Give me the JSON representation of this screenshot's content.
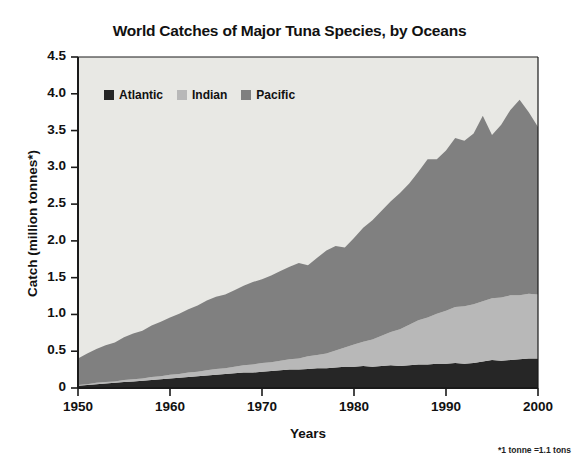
{
  "chart_data": {
    "type": "area",
    "stacked": true,
    "title": "World Catches of Major Tuna Species, by Oceans",
    "xlabel": "Years",
    "ylabel": "Catch (million tonnes*)",
    "footnote": "*1 tonne =1.1 tons",
    "xlim": [
      1950,
      2000
    ],
    "ylim": [
      0,
      4.5
    ],
    "grid": false,
    "legend_position": "top-left-inside",
    "plot_background": "#e8e8e4",
    "xticks": [
      1950,
      1960,
      1970,
      1980,
      1990,
      2000
    ],
    "xtick_labels": [
      "1950",
      "1960",
      "1970",
      "1980",
      "1990",
      "2000"
    ],
    "yticks": [
      0,
      0.5,
      1.0,
      1.5,
      2.0,
      2.5,
      3.0,
      3.5,
      4.0,
      4.5
    ],
    "ytick_labels": [
      "0",
      "0.5",
      "1.0",
      "1.5",
      "2.0",
      "2.5",
      "3.0",
      "3.5",
      "4.0",
      "4.5"
    ],
    "x": [
      1950,
      1951,
      1952,
      1953,
      1954,
      1955,
      1956,
      1957,
      1958,
      1959,
      1960,
      1961,
      1962,
      1963,
      1964,
      1965,
      1966,
      1967,
      1968,
      1969,
      1970,
      1971,
      1972,
      1973,
      1974,
      1975,
      1976,
      1977,
      1978,
      1979,
      1980,
      1981,
      1982,
      1983,
      1984,
      1985,
      1986,
      1987,
      1988,
      1989,
      1990,
      1991,
      1992,
      1993,
      1994,
      1995,
      1996,
      1997,
      1998,
      1999,
      2000
    ],
    "series": [
      {
        "name": "Atlantic",
        "color": "#262626",
        "values": [
          0.03,
          0.04,
          0.05,
          0.06,
          0.07,
          0.08,
          0.09,
          0.1,
          0.11,
          0.12,
          0.13,
          0.14,
          0.15,
          0.16,
          0.17,
          0.18,
          0.19,
          0.2,
          0.21,
          0.21,
          0.22,
          0.23,
          0.24,
          0.25,
          0.25,
          0.26,
          0.27,
          0.27,
          0.28,
          0.29,
          0.29,
          0.3,
          0.29,
          0.3,
          0.31,
          0.3,
          0.31,
          0.32,
          0.32,
          0.33,
          0.33,
          0.34,
          0.33,
          0.34,
          0.36,
          0.38,
          0.37,
          0.38,
          0.39,
          0.4,
          0.4
        ]
      },
      {
        "name": "Indian",
        "color": "#b8b8b8",
        "values": [
          0.01,
          0.01,
          0.02,
          0.02,
          0.02,
          0.03,
          0.03,
          0.03,
          0.04,
          0.04,
          0.05,
          0.05,
          0.06,
          0.06,
          0.07,
          0.08,
          0.08,
          0.09,
          0.1,
          0.11,
          0.12,
          0.12,
          0.13,
          0.14,
          0.15,
          0.17,
          0.18,
          0.2,
          0.23,
          0.26,
          0.3,
          0.33,
          0.37,
          0.41,
          0.45,
          0.5,
          0.55,
          0.6,
          0.64,
          0.68,
          0.72,
          0.76,
          0.78,
          0.8,
          0.82,
          0.84,
          0.86,
          0.88,
          0.87,
          0.88,
          0.87
        ]
      },
      {
        "name": "Pacific",
        "color": "#808080",
        "values": [
          0.36,
          0.42,
          0.46,
          0.5,
          0.53,
          0.58,
          0.62,
          0.65,
          0.7,
          0.74,
          0.78,
          0.82,
          0.86,
          0.9,
          0.95,
          0.98,
          1.0,
          1.04,
          1.08,
          1.12,
          1.14,
          1.18,
          1.22,
          1.26,
          1.3,
          1.24,
          1.32,
          1.4,
          1.42,
          1.36,
          1.45,
          1.55,
          1.62,
          1.7,
          1.78,
          1.85,
          1.92,
          2.02,
          2.15,
          2.1,
          2.18,
          2.3,
          2.25,
          2.32,
          2.52,
          2.22,
          2.35,
          2.52,
          2.66,
          2.47,
          2.28
        ]
      }
    ],
    "totals": [
      0.4,
      0.47,
      0.53,
      0.58,
      0.62,
      0.69,
      0.74,
      0.78,
      0.85,
      0.9,
      0.96,
      1.01,
      1.07,
      1.12,
      1.19,
      1.24,
      1.27,
      1.33,
      1.39,
      1.44,
      1.48,
      1.53,
      1.59,
      1.65,
      1.7,
      1.67,
      1.77,
      1.87,
      1.93,
      1.91,
      2.04,
      2.18,
      2.28,
      2.41,
      2.54,
      2.65,
      2.78,
      2.94,
      3.11,
      3.11,
      3.23,
      3.4,
      3.36,
      3.46,
      3.7,
      3.44,
      3.58,
      3.78,
      3.92,
      3.75,
      3.55
    ]
  },
  "legend": {
    "items": [
      {
        "label": "Atlantic",
        "color": "#262626"
      },
      {
        "label": "Indian",
        "color": "#b8b8b8"
      },
      {
        "label": "Pacific",
        "color": "#808080"
      }
    ]
  }
}
